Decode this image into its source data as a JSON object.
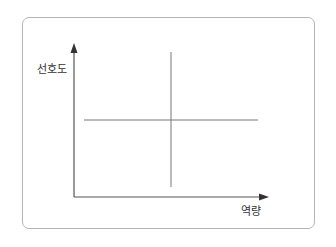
{
  "diagram": {
    "type": "quadrant-matrix",
    "y_axis_label": "선호도",
    "x_axis_label": "역량",
    "colors": {
      "axis": "#555555",
      "divider": "#777777",
      "frame": "#b5b5b5"
    }
  }
}
